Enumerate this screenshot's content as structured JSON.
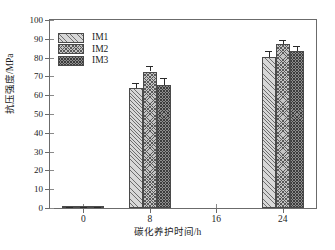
{
  "chart_data": {
    "type": "bar",
    "title": "",
    "subtitle": "",
    "xlabel": "碳化养护时间/h",
    "ylabel": "抗压强度/MPa",
    "categories": [
      "0",
      "8",
      "16",
      "24"
    ],
    "xlim": [
      -4,
      28
    ],
    "ylim": [
      0,
      100
    ],
    "ytick_labels": [
      "0",
      "10",
      "20",
      "30",
      "40",
      "50",
      "60",
      "70",
      "80",
      "90",
      "100"
    ],
    "ytick_values": [
      0,
      10,
      20,
      30,
      40,
      50,
      60,
      70,
      80,
      90,
      100
    ],
    "xtick_labels": [
      "0",
      "8",
      "16",
      "24"
    ],
    "xtick_values": [
      0,
      8,
      16,
      24
    ],
    "grid": false,
    "legend_position": "upper-left",
    "series": [
      {
        "name": "IM1",
        "pattern": "diagonal-hatch",
        "color": "#d8d8d8",
        "values": [
          0.3,
          63.7,
          null,
          80.5
        ],
        "errors": [
          0.4,
          2.6,
          null,
          3.0
        ]
      },
      {
        "name": "IM2",
        "pattern": "cross-hatch",
        "color": "#c4c4c4",
        "values": [
          0.3,
          72.6,
          null,
          87.4
        ],
        "errors": [
          0.4,
          2.8,
          null,
          1.8
        ]
      },
      {
        "name": "IM3",
        "pattern": "dense-cross-hatch",
        "color": "#8e8e8e",
        "values": [
          0.3,
          65.3,
          null,
          83.7
        ],
        "errors": [
          0.4,
          3.6,
          null,
          2.6
        ]
      }
    ]
  },
  "legend": {
    "entries": [
      {
        "label": "IM1"
      },
      {
        "label": "IM2"
      },
      {
        "label": "IM3"
      }
    ]
  },
  "axes": {
    "y_title": "抗压强度/MPa",
    "x_title": "碳化养护时间/h"
  }
}
